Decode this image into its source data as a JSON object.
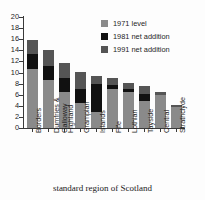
{
  "chart_data": {
    "type": "bar",
    "stacked": true,
    "title": "",
    "subtitle": "",
    "xlabel": "standard region of Scotland",
    "ylabel": "",
    "ylim": [
      0,
      20
    ],
    "ytick_step": 2,
    "grid": false,
    "legend_position": "top-right",
    "categories": [
      "Borders",
      "Dumfries &\nGalloway",
      "Highland",
      "Grampian",
      "Islands",
      "Fife",
      "Lothian",
      "Tayside",
      "Central",
      "Strathclyde"
    ],
    "ytick_labels": [
      "0",
      "2",
      "4",
      "6",
      "8",
      "10",
      "12",
      "14",
      "16",
      "18",
      "20"
    ],
    "series": [
      {
        "name": "1971 level",
        "color": "#8a8a8a",
        "values": [
          10.7,
          8.7,
          6.5,
          4.5,
          2.8,
          7.0,
          6.4,
          4.8,
          6.0,
          3.8
        ]
      },
      {
        "name": "1981 net addition",
        "color": "#111111",
        "values": [
          2.6,
          2.4,
          2.5,
          2.5,
          5.2,
          0.7,
          0.7,
          1.4,
          0.0,
          0.0
        ]
      },
      {
        "name": "1991 net addition",
        "color": "#555555",
        "values": [
          2.6,
          2.9,
          2.7,
          3.1,
          1.3,
          1.3,
          1.1,
          1.4,
          0.4,
          0.4
        ]
      }
    ],
    "totals": [
      15.9,
      14.0,
      11.7,
      10.1,
      9.3,
      9.0,
      8.2,
      7.6,
      6.4,
      4.2
    ]
  },
  "legend": {
    "items": [
      {
        "label": "1971 level",
        "color": "#8a8a8a"
      },
      {
        "label": "1981 net addition",
        "color": "#111111"
      },
      {
        "label": "1991 net addition",
        "color": "#555555"
      }
    ]
  },
  "axis": {
    "x_title": "standard region of Scotland"
  }
}
